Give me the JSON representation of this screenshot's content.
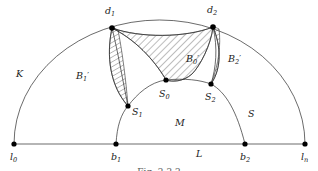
{
  "figure": {
    "caption": "Fig. 2.2.2",
    "background_color": "#ffffff",
    "stroke_color": "#2b2b2b",
    "node_color": "#000000",
    "labels": {
      "outer_arc": {
        "base": "K",
        "sub": "",
        "prime": ""
      },
      "baseline": {
        "base": "L",
        "sub": "",
        "prime": ""
      },
      "inner_arc": {
        "base": "S",
        "sub": "",
        "prime": ""
      },
      "interior_region": {
        "base": "M",
        "sub": "",
        "prime": ""
      },
      "left_end": {
        "base": "l",
        "sub": "0",
        "prime": ""
      },
      "right_end": {
        "base": "l",
        "sub": "n",
        "prime": ""
      },
      "base_left": {
        "base": "b",
        "sub": "1",
        "prime": ""
      },
      "base_right": {
        "base": "b",
        "sub": "2",
        "prime": ""
      },
      "top_left": {
        "base": "d",
        "sub": "1",
        "prime": ""
      },
      "top_right": {
        "base": "d",
        "sub": "2",
        "prime": ""
      },
      "s_left": {
        "base": "S",
        "sub": "1",
        "prime": ""
      },
      "s_mid": {
        "base": "S",
        "sub": "0",
        "prime": ""
      },
      "s_right": {
        "base": "S",
        "sub": "2",
        "prime": ""
      },
      "b_left": {
        "base": "B",
        "sub": "1",
        "prime": "′"
      },
      "b_mid": {
        "base": "B",
        "sub": "0",
        "prime": "′"
      },
      "b_right": {
        "base": "B",
        "sub": "2",
        "prime": "′"
      }
    },
    "points": {
      "l0": {
        "x": 14,
        "y": 144
      },
      "b1": {
        "x": 116,
        "y": 144
      },
      "b2": {
        "x": 245,
        "y": 144
      },
      "ln": {
        "x": 305,
        "y": 144
      },
      "d1": {
        "x": 112,
        "y": 28
      },
      "d2": {
        "x": 213,
        "y": 27
      },
      "S1": {
        "x": 128,
        "y": 106
      },
      "S0": {
        "x": 166,
        "y": 80
      },
      "S2": {
        "x": 211,
        "y": 84
      }
    }
  }
}
